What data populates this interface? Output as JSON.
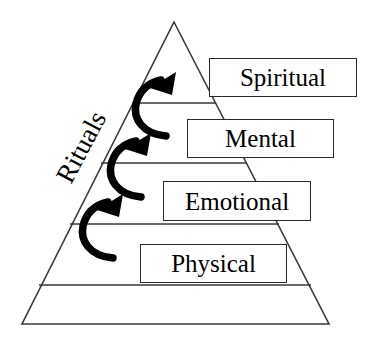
{
  "diagram": {
    "type": "pyramid",
    "background_color": "#ffffff",
    "outline_color": "#3a3a3a",
    "arrow_color": "#000000",
    "text_color": "#000000",
    "side_label": {
      "text": "Rituals",
      "rotation_degrees": -62
    },
    "tiers": [
      {
        "id": "spiritual",
        "label": "Spiritual",
        "level": 4,
        "position": "top"
      },
      {
        "id": "mental",
        "label": "Mental",
        "level": 3,
        "position": "upper-middle"
      },
      {
        "id": "emotional",
        "label": "Emotional",
        "level": 2,
        "position": "lower-middle"
      },
      {
        "id": "physical",
        "label": "Physical",
        "level": 1,
        "position": "bottom"
      }
    ],
    "arrows": [
      {
        "id": "arrow-physical-to-emotional",
        "direction": "upward-curved",
        "from": "Physical",
        "to": "Emotional"
      },
      {
        "id": "arrow-emotional-to-mental",
        "direction": "upward-curved",
        "from": "Emotional",
        "to": "Mental"
      },
      {
        "id": "arrow-mental-to-spiritual",
        "direction": "upward-curved",
        "from": "Mental",
        "to": "Spiritual"
      }
    ]
  }
}
